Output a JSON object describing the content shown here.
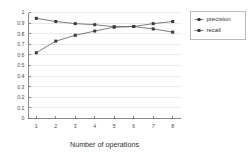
{
  "chart_data": {
    "type": "line",
    "title": "",
    "xlabel": "Number of operations",
    "ylabel": "",
    "x": [
      1,
      2,
      3,
      4,
      5,
      6,
      7,
      8
    ],
    "xtick_labels": [
      "1",
      "2",
      "3",
      "4",
      "5",
      "6",
      "7",
      "8"
    ],
    "ytick_labels": [
      "0",
      "0.1",
      "0.2",
      "0.3",
      "0.4",
      "0.5",
      "0.6",
      "0.7",
      "0.8",
      "0.9",
      "1"
    ],
    "ytick_values": [
      0,
      0.1,
      0.2,
      0.3,
      0.4,
      0.5,
      0.6,
      0.7,
      0.8,
      0.9,
      1
    ],
    "xlim": [
      0.6,
      8.4
    ],
    "ylim": [
      0,
      1
    ],
    "grid": "horizontal",
    "legend_position": "right-outside",
    "series": [
      {
        "name": "precision",
        "values": [
          0.945,
          0.915,
          0.895,
          0.885,
          0.865,
          0.868,
          0.845,
          0.815
        ],
        "color": "#5a5a5a",
        "marker": "square"
      },
      {
        "name": "recall",
        "values": [
          0.62,
          0.73,
          0.785,
          0.825,
          0.862,
          0.868,
          0.895,
          0.915
        ],
        "color": "#5a5a5a",
        "marker": "square"
      }
    ]
  },
  "legend": {
    "entries": [
      {
        "label": "precision"
      },
      {
        "label": "recall"
      }
    ]
  },
  "axes": {
    "x_title": "Number of operations"
  }
}
